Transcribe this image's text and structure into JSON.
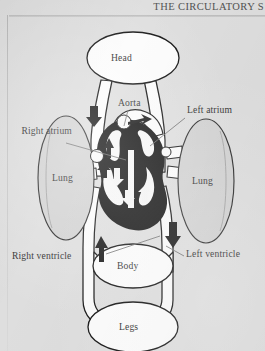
{
  "header": {
    "title": "THE CIRCULATORY S",
    "rule_color": "#b9b9b9"
  },
  "figure": {
    "background_color": "#dedede",
    "ink_color": "#1a1a1a",
    "organs": [
      {
        "name": "head",
        "label": "Head",
        "cx": 133,
        "cy": 58,
        "rx": 46,
        "ry": 26
      },
      {
        "name": "lung-left",
        "label": "Lung",
        "cx": 66,
        "cy": 178,
        "rx": 28,
        "ry": 62
      },
      {
        "name": "lung-right",
        "label": "Lung",
        "cx": 206,
        "cy": 181,
        "rx": 28,
        "ry": 62
      },
      {
        "name": "body",
        "label": "Body",
        "cx": 133,
        "cy": 266,
        "rx": 40,
        "ry": 22
      },
      {
        "name": "legs",
        "label": "Legs",
        "cx": 133,
        "cy": 327,
        "rx": 45,
        "ry": 25
      }
    ],
    "callouts": [
      {
        "name": "aorta",
        "label": "Aorta",
        "x": 118,
        "y": 103,
        "align": "left"
      },
      {
        "name": "right-atrium",
        "label": "Right atrium",
        "x": 16,
        "y": 131,
        "align": "right"
      },
      {
        "name": "left-atrium",
        "label": "Left atrium",
        "x": 186,
        "y": 108,
        "align": "left"
      },
      {
        "name": "right-ventricle",
        "label": "Right ventricle",
        "x": 12,
        "y": 255,
        "align": "left"
      },
      {
        "name": "left-ventricle",
        "label": "Left ventricle",
        "x": 186,
        "y": 253,
        "align": "left"
      }
    ],
    "flow_arrows": [
      {
        "name": "arrow-head-return-down",
        "direction": "down",
        "x": 94,
        "y": 112
      },
      {
        "name": "arrow-aorta-up",
        "direction": "up",
        "x": 109,
        "y": 146
      },
      {
        "name": "arrow-aorta-out-right",
        "direction": "right",
        "x": 140,
        "y": 122
      },
      {
        "name": "arrow-body-return-up",
        "direction": "up",
        "x": 101,
        "y": 248
      },
      {
        "name": "arrow-to-body-down",
        "direction": "down",
        "x": 173,
        "y": 233
      }
    ]
  }
}
